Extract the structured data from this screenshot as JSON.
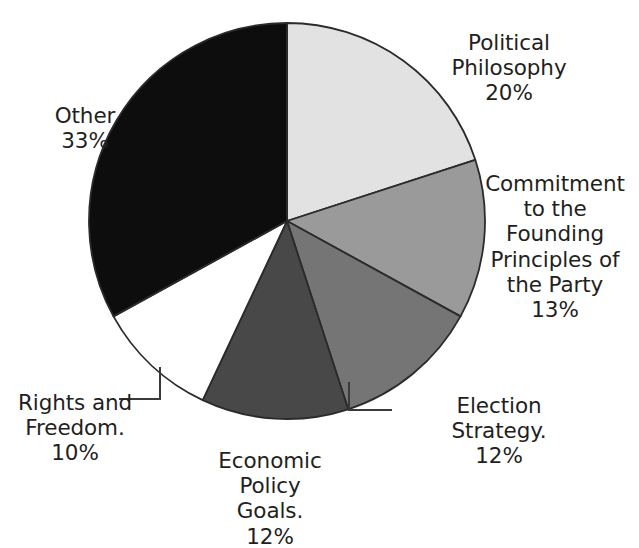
{
  "chart_data": {
    "type": "pie",
    "title": "",
    "subtitle": "",
    "xlabel": "",
    "ylabel": "",
    "legend_position": "none",
    "grid": false,
    "labels_show_percent": true,
    "start_angle_deg": 0,
    "direction": "clockwise",
    "categories": [
      "Political Philosophy",
      "Commitment to the Founding Principles of the Party",
      "Election Strategy.",
      "Economic Policy Goals.",
      "Rights and Freedom.",
      "Other"
    ],
    "values": [
      20,
      13,
      12,
      12,
      10,
      33
    ],
    "units": "%",
    "colors": [
      "#e2e2e2",
      "#9a9a9a",
      "#757575",
      "#484848",
      "#ffffff",
      "#0d0d0d"
    ],
    "slices": [
      {
        "name": "Political Philosophy",
        "value": 20,
        "percent_text": "20%",
        "color": "#e2e2e2",
        "start_deg": 0,
        "end_deg": 72,
        "label_lines": [
          "Political",
          "Philosophy"
        ],
        "leader_line": false
      },
      {
        "name": "Commitment to the Founding Principles of the Party",
        "value": 13,
        "percent_text": "13%",
        "color": "#9a9a9a",
        "start_deg": 72,
        "end_deg": 118.8,
        "label_lines": [
          "Commitment",
          "to the",
          "Founding",
          "Principles of",
          "the Party"
        ],
        "leader_line": false
      },
      {
        "name": "Election Strategy.",
        "value": 12,
        "percent_text": "12%",
        "color": "#757575",
        "start_deg": 118.8,
        "end_deg": 162,
        "label_lines": [
          "Election",
          "Strategy."
        ],
        "leader_line": true
      },
      {
        "name": "Economic Policy Goals.",
        "value": 12,
        "percent_text": "12%",
        "color": "#484848",
        "start_deg": 162,
        "end_deg": 205.2,
        "label_lines": [
          "Economic",
          "Policy",
          "Goals."
        ],
        "leader_line": false
      },
      {
        "name": "Rights and Freedom.",
        "value": 10,
        "percent_text": "10%",
        "color": "#ffffff",
        "start_deg": 205.2,
        "end_deg": 241.2,
        "label_lines": [
          "Rights and",
          "Freedom."
        ],
        "leader_line": true
      },
      {
        "name": "Other",
        "value": 33,
        "percent_text": "33%",
        "color": "#0d0d0d",
        "start_deg": 241.2,
        "end_deg": 360,
        "label_lines": [
          "Other"
        ],
        "leader_line": false
      }
    ]
  },
  "labels": {
    "political_philosophy": {
      "text": "Political\nPhilosophy",
      "percent": "20%"
    },
    "commitment": {
      "text": "Commitment\nto the\nFounding\nPrinciples of\nthe Party",
      "percent": "13%"
    },
    "election_strategy": {
      "text": "Election\nStrategy.",
      "percent": "12%"
    },
    "economic_policy": {
      "text": "Economic\nPolicy\nGoals.",
      "percent": "12%"
    },
    "rights_freedom": {
      "text": "Rights and\nFreedom.",
      "percent": "10%"
    },
    "other": {
      "text": "Other",
      "percent": "33%"
    }
  }
}
